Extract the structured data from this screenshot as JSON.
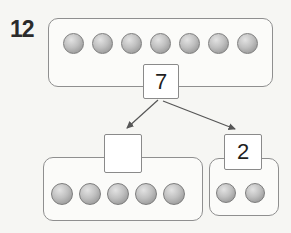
{
  "problem_number": "12",
  "diagram": {
    "top_group": {
      "counter_count": 7,
      "value_label": "7"
    },
    "left_group": {
      "counter_count": 5,
      "value_label": ""
    },
    "right_group": {
      "counter_count": 2,
      "value_label": "2"
    }
  },
  "colors": {
    "background": "#f6f6f3",
    "outline": "#8f8f8f",
    "box_border": "#8a8a8a",
    "box_fill": "#ffffff",
    "group_fill": "#fbfbf9",
    "arrow": "#565656",
    "counter_light": "#e3e3e3",
    "counter_mid": "#c0c0c0",
    "counter_dark": "#979797",
    "counter_border": "#7d7d7d",
    "text": "#2b2b2b"
  }
}
